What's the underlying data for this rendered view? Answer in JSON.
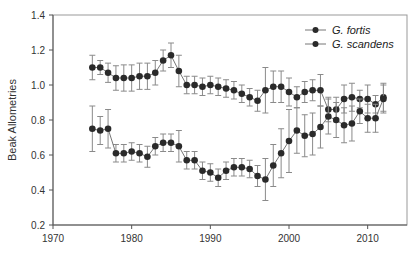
{
  "chart_data": {
    "type": "line",
    "title": "",
    "xlabel": "",
    "ylabel": "Beak Allometries",
    "xlim": [
      1970,
      2015
    ],
    "ylim": [
      0.2,
      1.4
    ],
    "xticks": [
      1970,
      1980,
      1990,
      2000,
      2010
    ],
    "yticks": [
      0.2,
      0.4,
      0.6,
      0.8,
      1.0,
      1.2,
      1.4
    ],
    "ytick_labels": [
      "0.2",
      "0.4",
      "0.6",
      "0.8",
      "1.0",
      "1.2",
      "1.4"
    ],
    "grid": false,
    "legend_position": "top-right",
    "x": [
      1975,
      1976,
      1977,
      1978,
      1979,
      1980,
      1981,
      1982,
      1983,
      1984,
      1985,
      1986,
      1987,
      1988,
      1989,
      1990,
      1991,
      1992,
      1993,
      1994,
      1995,
      1996,
      1997,
      1998,
      1999,
      2000,
      2001,
      2002,
      2003,
      2004,
      2005,
      2006,
      2007,
      2008,
      2009,
      2010,
      2011,
      2012
    ],
    "series": [
      {
        "name": "G. fortis",
        "values": [
          1.1,
          1.1,
          1.07,
          1.04,
          1.04,
          1.04,
          1.05,
          1.05,
          1.07,
          1.14,
          1.17,
          1.08,
          1.0,
          1.0,
          0.99,
          1.0,
          0.99,
          0.98,
          0.97,
          0.95,
          0.93,
          0.91,
          0.97,
          0.99,
          0.99,
          0.96,
          0.93,
          0.96,
          0.97,
          0.97,
          0.86,
          0.86,
          0.92,
          0.93,
          0.92,
          0.92,
          0.89,
          0.93
        ],
        "errors": [
          0.07,
          0.04,
          0.055,
          0.07,
          0.075,
          0.075,
          0.075,
          0.075,
          0.07,
          0.06,
          0.07,
          0.09,
          0.05,
          0.05,
          0.05,
          0.05,
          0.05,
          0.05,
          0.05,
          0.05,
          0.05,
          0.06,
          0.13,
          0.09,
          0.09,
          0.08,
          0.06,
          0.06,
          0.06,
          0.09,
          0.07,
          0.07,
          0.08,
          0.08,
          0.05,
          0.08,
          0.05,
          0.08
        ]
      },
      {
        "name": "G. scandens",
        "values": [
          0.75,
          0.74,
          0.75,
          0.61,
          0.61,
          0.62,
          0.61,
          0.59,
          0.65,
          0.67,
          0.67,
          0.65,
          0.57,
          0.57,
          0.51,
          0.5,
          0.47,
          0.51,
          0.53,
          0.53,
          0.52,
          0.48,
          0.46,
          0.54,
          0.61,
          0.68,
          0.74,
          0.71,
          0.72,
          0.76,
          0.82,
          0.8,
          0.77,
          0.78,
          0.85,
          0.81,
          0.81,
          0.92
        ],
        "errors": [
          0.13,
          0.08,
          0.11,
          0.05,
          0.05,
          0.05,
          0.05,
          0.06,
          0.05,
          0.05,
          0.05,
          0.09,
          0.05,
          0.05,
          0.05,
          0.05,
          0.05,
          0.05,
          0.05,
          0.05,
          0.05,
          0.06,
          0.12,
          0.12,
          0.14,
          0.18,
          0.13,
          0.12,
          0.12,
          0.12,
          0.1,
          0.1,
          0.1,
          0.1,
          0.07,
          0.08,
          0.08,
          0.08
        ]
      }
    ]
  },
  "legend": {
    "items": [
      {
        "label": "G. fortis"
      },
      {
        "label": "G. scandens"
      }
    ]
  },
  "colors": {
    "marker": "#2a2a2a",
    "line": "#777777",
    "errorbar": "#8a8a8a",
    "axis": "#555555",
    "frame": "#999999"
  }
}
